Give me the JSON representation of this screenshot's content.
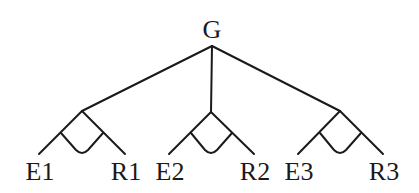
{
  "root": {
    "label": "G"
  },
  "groups": [
    {
      "left": "E1",
      "right": "R1"
    },
    {
      "left": "E2",
      "right": "R2"
    },
    {
      "left": "E3",
      "right": "R3"
    }
  ]
}
